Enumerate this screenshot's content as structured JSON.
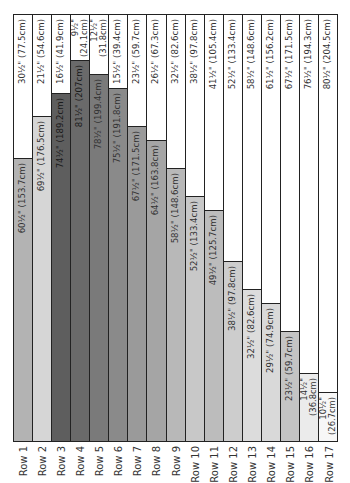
{
  "chart_data": {
    "type": "bar",
    "orientation": "stacked-vertical (rotated 90°)",
    "title": "",
    "xlabel": "",
    "ylabel": "",
    "total_inches": 91,
    "categories": [
      "Row 1",
      "Row 2",
      "Row 3",
      "Row 4",
      "Row 5",
      "Row 6",
      "Row 7",
      "Row 8",
      "Row 9",
      "Row 10",
      "Row 11",
      "Row 12",
      "Row 13",
      "Row 14",
      "Row 15",
      "Row 16",
      "Row 17"
    ],
    "series": [
      {
        "name": "shaded",
        "values_in": [
          60.5,
          69.5,
          74.5,
          81.5,
          78.5,
          75.5,
          67.5,
          64.5,
          58.5,
          52.5,
          49.5,
          38.5,
          32.5,
          29.5,
          23.5,
          14.5,
          10.5
        ],
        "labels": [
          "60½\" (153.7cm)",
          "69½\" (176.5cm)",
          "74½\" (189.2cm)",
          "81½\" (207cm)",
          "78½\" (199.4cm)",
          "75½\" (191.8cm)",
          "67½\" (171.5cm)",
          "64½\" (163.8cm)",
          "58½\" (148.6cm)",
          "52½\" (133.4cm)",
          "49½\" (125.7cm)",
          "38½\" (97.8cm)",
          "32½\" (82.6cm)",
          "29½\" (74.9cm)",
          "23½\" (59.7cm)",
          "14½\"|(36.8cm)",
          "10½\"|(26.7cm)"
        ],
        "colors": [
          "#b3b3b3",
          "#d6d6d6",
          "#5e5e5e",
          "#6a6a6a",
          "#7a7a7a",
          "#8a8a8a",
          "#9a9a9a",
          "#a5a5a5",
          "#b8b8b8",
          "#c8c8c8",
          "#bcbcbc",
          "#cdcdcd",
          "#dcdcdc",
          "#d9d9d9",
          "#c4c4c4",
          "#ebebeb",
          "#f7f7f7"
        ]
      },
      {
        "name": "white",
        "values_in": [
          30.5,
          21.5,
          16.5,
          9.5,
          12.5,
          15.5,
          23.5,
          26.5,
          32.5,
          38.5,
          41.5,
          52.5,
          58.5,
          61.5,
          67.5,
          76.5,
          80.5
        ],
        "labels": [
          "30½\" (77.5cm)",
          "21½\" (54.6cm)",
          "16½\" (41.9cm)",
          "9½\"|(24.1cm)",
          "12½\"|(31.8cm)",
          "15½\" (39.4cm)",
          "23½\" (59.7cm)",
          "26½\" (67.3cm)",
          "32½\" (82.6cm)",
          "38½\" (97.8cm)",
          "41½\" (105.4cm)",
          "52½\" (133.4cm)",
          "58½\" (148.6cm)",
          "61½\" (156.2cm)",
          "67½\" (171.5cm)",
          "76½\" (194.3cm)",
          "80½\" (204.5cm)"
        ],
        "color": "#ffffff"
      }
    ],
    "grid": false,
    "legend": "none"
  }
}
